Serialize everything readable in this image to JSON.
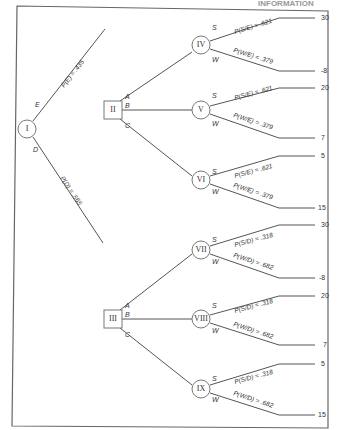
{
  "header": {
    "title": "INFORMATION"
  },
  "root": {
    "id": "I",
    "type": "chance"
  },
  "first_branches": [
    {
      "label": "E",
      "prob": "P(E) = .435",
      "to": "II"
    },
    {
      "label": "D",
      "prob": "P(D) = .565",
      "to": "III"
    }
  ],
  "decision_nodes": [
    {
      "id": "II",
      "branches": [
        "A",
        "B",
        "C"
      ],
      "children": [
        "IV",
        "V",
        "VI"
      ]
    },
    {
      "id": "III",
      "branches": [
        "A",
        "B",
        "C"
      ],
      "children": [
        "VII",
        "VIII",
        "IX"
      ]
    }
  ],
  "chance_nodes": [
    {
      "id": "IV",
      "s_label": "S",
      "w_label": "W",
      "s_prob": "P(S/E) = .621",
      "w_prob": "P(W/E) = .379",
      "s_payoff": "30",
      "w_payoff": "-8"
    },
    {
      "id": "V",
      "s_label": "S",
      "w_label": "W",
      "s_prob": "P(S/E) = .621",
      "w_prob": "P(W/E) = .379",
      "s_payoff": "20",
      "w_payoff": "7"
    },
    {
      "id": "VI",
      "s_label": "S",
      "w_label": "W",
      "s_prob": "P(S/E) = .621",
      "w_prob": "P(W/E) = .379",
      "s_payoff": "5",
      "w_payoff": "15"
    },
    {
      "id": "VII",
      "s_label": "S",
      "w_label": "W",
      "s_prob": "P(S/D) = .318",
      "w_prob": "P(W/D) = .682",
      "s_payoff": "30",
      "w_payoff": "-8"
    },
    {
      "id": "VIII",
      "s_label": "S",
      "w_label": "W",
      "s_prob": "P(S/D) = .318",
      "w_prob": "P(W/D) = .682",
      "s_payoff": "20",
      "w_payoff": "7"
    },
    {
      "id": "IX",
      "s_label": "S",
      "w_label": "W",
      "s_prob": "P(S/D) = .318",
      "w_prob": "P(W/D) = .682",
      "s_payoff": "5",
      "w_payoff": "15"
    }
  ]
}
